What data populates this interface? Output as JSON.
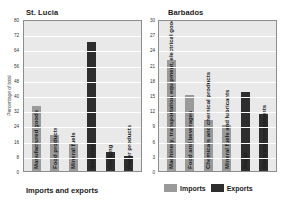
{
  "legend": {
    "position": "bottom-right",
    "items": [
      {
        "label": "Imports",
        "color": "#9a9a9a"
      },
      {
        "label": "Exports",
        "color": "#2e2e2e"
      }
    ]
  },
  "xlabel_left": "Imports and exports",
  "chart_data": [
    {
      "type": "bar",
      "title": "St. Lucia",
      "xlabel": "Imports and exports",
      "ylabel": "Percentage of total",
      "ylim": [
        0,
        80
      ],
      "ystep": 8,
      "yticks": [
        "80",
        "72",
        "64",
        "56",
        "48",
        "40",
        "32",
        "24",
        "16",
        "8",
        "0"
      ],
      "grid": true,
      "categories": [
        "Manufactured goods",
        "Food products",
        "Mineral fuels",
        "Bananas",
        "Clothing",
        "Paper products"
      ],
      "values": [
        34,
        19,
        14,
        68,
        10,
        8
      ],
      "series_of_bar": [
        "Imports",
        "Imports",
        "Imports",
        "Exports",
        "Exports",
        "Exports"
      ]
    },
    {
      "type": "bar",
      "title": "Barbados",
      "xlabel": "",
      "ylabel": "",
      "ylim": [
        0,
        30
      ],
      "ystep": 3,
      "yticks": [
        "30",
        "27",
        "24",
        "21",
        "18",
        "15",
        "12",
        "9",
        "6",
        "3",
        "0"
      ],
      "grid": true,
      "categories": [
        "Machinery, transportation equipment, electrical goods",
        "Food and beverages",
        "Chemicals and chemical products",
        "Mineral fuels and lubricants",
        "Sugar",
        "Electrical components"
      ],
      "values": [
        22,
        15,
        10,
        9,
        15.5,
        11.3
      ],
      "series_of_bar": [
        "Imports",
        "Imports",
        "Imports",
        "Imports",
        "Exports",
        "Exports"
      ]
    }
  ]
}
